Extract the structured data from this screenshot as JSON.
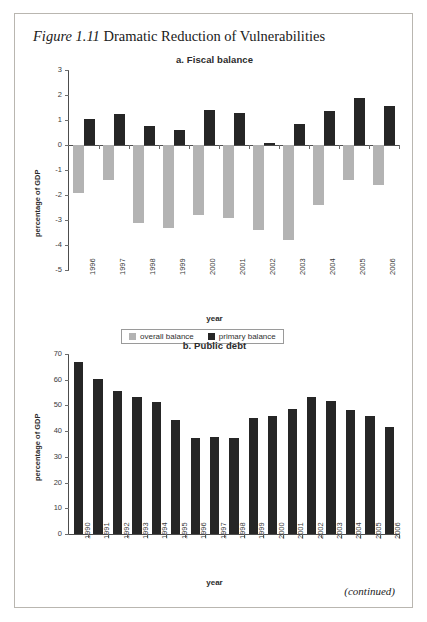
{
  "figure": {
    "label": "Figure 1.11",
    "caption": "Dramatic Reduction of Vulnerabilities",
    "continued_note": "(continued)"
  },
  "colors": {
    "overall_balance": "#b3b3b3",
    "primary_balance": "#262626",
    "public_debt": "#262626",
    "axis": "#4d4d4d",
    "page_border": "#b9b6b0"
  },
  "chart_data": [
    {
      "id": "fiscal-balance",
      "type": "bar",
      "title": "a. Fiscal balance",
      "xlabel": "year",
      "ylabel": "percentage of GDP",
      "ylim": [
        -5,
        3
      ],
      "yticks": [
        3,
        2,
        1,
        0,
        -1,
        -2,
        -3,
        -4,
        -5
      ],
      "ytick_labels": [
        "3",
        "2",
        "1",
        "0",
        "-1",
        "-2",
        "-3",
        "-4",
        "-5"
      ],
      "grid": false,
      "legend_position": "bottom",
      "categories": [
        "1996",
        "1997",
        "1998",
        "1999",
        "2000",
        "2001",
        "2002",
        "2003",
        "2004",
        "2005",
        "2006"
      ],
      "series": [
        {
          "name": "overall balance",
          "color": "#b3b3b3",
          "values": [
            -1.9,
            -1.4,
            -3.1,
            -3.3,
            -2.8,
            -2.9,
            -3.4,
            -3.8,
            -2.4,
            -1.4,
            -1.6
          ]
        },
        {
          "name": "primary balance",
          "color": "#262626",
          "values": [
            1.05,
            1.25,
            0.75,
            0.6,
            1.4,
            1.3,
            0.1,
            0.85,
            1.35,
            1.9,
            1.55
          ]
        }
      ]
    },
    {
      "id": "public-debt",
      "type": "bar",
      "title": "b. Public debt",
      "xlabel": "year",
      "ylabel": "percentage of GDP",
      "ylim": [
        0,
        70
      ],
      "yticks": [
        70,
        60,
        50,
        40,
        30,
        20,
        10,
        0
      ],
      "ytick_labels": [
        "70",
        "60",
        "50",
        "40",
        "30",
        "20",
        "10",
        "0"
      ],
      "grid": false,
      "legend_position": "none",
      "categories": [
        "1990",
        "1991",
        "1992",
        "1993",
        "1994",
        "1995",
        "1996",
        "1997",
        "1998",
        "1999",
        "2000",
        "2001",
        "2002",
        "2003",
        "2004",
        "2005",
        "2006"
      ],
      "series": [
        {
          "name": "public debt",
          "color": "#262626",
          "values": [
            67.0,
            60.3,
            55.5,
            53.3,
            51.5,
            44.2,
            37.2,
            37.7,
            37.2,
            45.0,
            46.0,
            48.5,
            53.2,
            51.8,
            48.2,
            46.0,
            41.5
          ]
        }
      ]
    }
  ]
}
